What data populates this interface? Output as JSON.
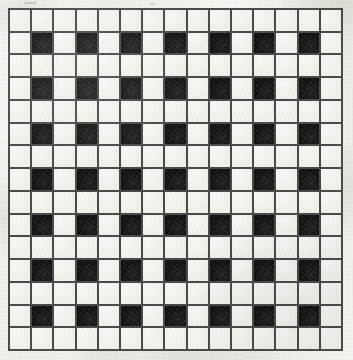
{
  "figure": {
    "kind": "grid-illusion-plate",
    "rows": 15,
    "columns": 15,
    "cell_size_px": 23,
    "origin_px": {
      "x": 8,
      "y": 8
    },
    "plate_size_px": {
      "width": 335,
      "height": 343
    },
    "colors": {
      "paper": "#f4f3ef",
      "light_cell": "#f0efe9",
      "dark_cell": "#121211",
      "grid_line": "#4a4a48"
    },
    "grid_line_width_px": 2,
    "pattern_description": "Odd-numbered rows are entirely light; even-numbered rows alternate light and dark starting with light, so dark squares fall on even columns of even rows.",
    "counts": {
      "total_cells": 225,
      "dark_cells": 49,
      "light_cells": 176,
      "dark_cells_per_dark_row": 7,
      "dark_rows": 7,
      "light_rows": 8
    },
    "dark_row_indices": [
      2,
      4,
      6,
      8,
      10,
      12,
      14
    ],
    "dark_column_indices": [
      2,
      4,
      6,
      8,
      10,
      12,
      14
    ],
    "matrix": [
      [
        0,
        0,
        0,
        0,
        0,
        0,
        0,
        0,
        0,
        0,
        0,
        0,
        0,
        0,
        0
      ],
      [
        0,
        1,
        0,
        1,
        0,
        1,
        0,
        1,
        0,
        1,
        0,
        1,
        0,
        1,
        0
      ],
      [
        0,
        0,
        0,
        0,
        0,
        0,
        0,
        0,
        0,
        0,
        0,
        0,
        0,
        0,
        0
      ],
      [
        0,
        1,
        0,
        1,
        0,
        1,
        0,
        1,
        0,
        1,
        0,
        1,
        0,
        1,
        0
      ],
      [
        0,
        0,
        0,
        0,
        0,
        0,
        0,
        0,
        0,
        0,
        0,
        0,
        0,
        0,
        0
      ],
      [
        0,
        1,
        0,
        1,
        0,
        1,
        0,
        1,
        0,
        1,
        0,
        1,
        0,
        1,
        0
      ],
      [
        0,
        0,
        0,
        0,
        0,
        0,
        0,
        0,
        0,
        0,
        0,
        0,
        0,
        0,
        0
      ],
      [
        0,
        1,
        0,
        1,
        0,
        1,
        0,
        1,
        0,
        1,
        0,
        1,
        0,
        1,
        0
      ],
      [
        0,
        0,
        0,
        0,
        0,
        0,
        0,
        0,
        0,
        0,
        0,
        0,
        0,
        0,
        0
      ],
      [
        0,
        1,
        0,
        1,
        0,
        1,
        0,
        1,
        0,
        1,
        0,
        1,
        0,
        1,
        0
      ],
      [
        0,
        0,
        0,
        0,
        0,
        0,
        0,
        0,
        0,
        0,
        0,
        0,
        0,
        0,
        0
      ],
      [
        0,
        1,
        0,
        1,
        0,
        1,
        0,
        1,
        0,
        1,
        0,
        1,
        0,
        1,
        0
      ],
      [
        0,
        0,
        0,
        0,
        0,
        0,
        0,
        0,
        0,
        0,
        0,
        0,
        0,
        0,
        0
      ],
      [
        0,
        1,
        0,
        1,
        0,
        1,
        0,
        1,
        0,
        1,
        0,
        1,
        0,
        1,
        0
      ],
      [
        0,
        0,
        0,
        0,
        0,
        0,
        0,
        0,
        0,
        0,
        0,
        0,
        0,
        0,
        0
      ]
    ]
  },
  "annotations": {
    "stray_marks": [
      {
        "name": "top-left-pencil-smudge",
        "left": 24,
        "top": 2
      },
      {
        "name": "top-center-pencil-dot",
        "left": 150,
        "top": 3
      },
      {
        "name": "interior-speck",
        "left": 101,
        "top": 63
      }
    ]
  }
}
